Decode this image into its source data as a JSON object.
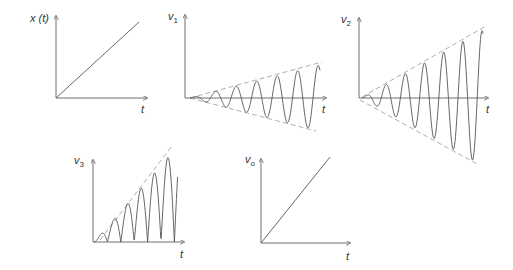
{
  "diagram": {
    "type": "signal-waveform-panels",
    "colors": {
      "axis": "#6e6e6e",
      "curve": "#555555",
      "envelope": "#9a9a9a",
      "text": "#333333"
    },
    "panels": [
      {
        "id": "x_t",
        "ylabel": "x (t)",
        "ylabel_main": "x (t)",
        "ylabel_sub": "",
        "xlabel": "t",
        "kind": "ramp",
        "origin": [
          56,
          98
        ],
        "y_top": 16,
        "x_end": 147,
        "ramp_end": [
          139,
          22
        ],
        "label_pos": [
          30,
          22
        ],
        "t_pos": [
          141,
          113
        ]
      },
      {
        "id": "v1",
        "ylabel_main": "v",
        "ylabel_sub": "1",
        "xlabel": "t",
        "kind": "growing-sine",
        "origin": [
          185,
          98
        ],
        "y_top": 15,
        "x_end": 326,
        "wave_start": 190,
        "wave_end": 320,
        "period": 20.5,
        "amp_start": 0,
        "amp_end": 33,
        "envelope_upper": [
          [
            190,
            98
          ],
          [
            322,
            62
          ]
        ],
        "envelope_lower": [
          [
            190,
            98
          ],
          [
            316,
            131
          ]
        ],
        "label_pos": [
          168,
          20
        ],
        "t_pos": [
          322,
          113
        ]
      },
      {
        "id": "v2",
        "ylabel_main": "v",
        "ylabel_sub": "2",
        "xlabel": "t",
        "kind": "growing-sine",
        "origin": [
          359,
          98
        ],
        "y_top": 18,
        "x_end": 488,
        "wave_start": 362,
        "wave_end": 483,
        "period": 19.2,
        "amp_start": 0,
        "amp_end": 68,
        "envelope_upper": [
          [
            362,
            97
          ],
          [
            486,
            26
          ]
        ],
        "envelope_lower": [
          [
            360,
            100
          ],
          [
            479,
            165
          ]
        ],
        "label_pos": [
          341,
          23
        ],
        "t_pos": [
          486,
          113
        ]
      },
      {
        "id": "v3",
        "ylabel_main": "v",
        "ylabel_sub": "3",
        "xlabel": "t",
        "kind": "rectified-growing-sine",
        "origin": [
          93,
          242
        ],
        "y_top": 160,
        "x_end": 184,
        "wave_start": 94,
        "wave_end": 178,
        "half_period": 13.4,
        "amp_start": 0,
        "amp_end": 96,
        "envelope": [
          [
            100,
            240
          ],
          [
            172,
            146
          ]
        ],
        "label_pos": [
          74,
          164
        ],
        "t_pos": [
          180,
          258
        ]
      },
      {
        "id": "vo",
        "ylabel_main": "v",
        "ylabel_sub": "o",
        "xlabel": "t",
        "kind": "ramp",
        "origin": [
          261,
          243
        ],
        "y_top": 159,
        "x_end": 350,
        "ramp_end": [
          330,
          157
        ],
        "label_pos": [
          245,
          163
        ],
        "t_pos": [
          346,
          260
        ]
      }
    ]
  }
}
